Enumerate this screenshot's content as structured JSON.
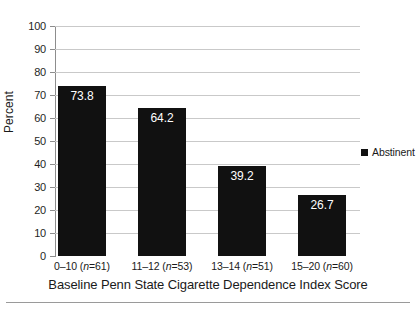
{
  "chart_data": {
    "type": "bar",
    "title": "",
    "subtitle": "",
    "xlabel": "Baseline Penn State Cigarette Dependence Index Score",
    "ylabel": "Percent",
    "categories": [
      "0–10 (n=61)",
      "11–12 (n=53)",
      "13–14 (n=51)",
      "15–20 (n=60)"
    ],
    "category_parts": [
      {
        "range": "0–10",
        "n_prefix": " (",
        "n_var": "n",
        "n_value": "=61)"
      },
      {
        "range": "11–12",
        "n_prefix": " (",
        "n_var": "n",
        "n_value": "=53)"
      },
      {
        "range": "13–14",
        "n_prefix": " (",
        "n_var": "n",
        "n_value": "=51)"
      },
      {
        "range": "15–20",
        "n_prefix": " (",
        "n_var": "n",
        "n_value": "=60)"
      }
    ],
    "values": [
      73.8,
      64.2,
      39.2,
      26.7
    ],
    "value_labels": [
      "73.8",
      "64.2",
      "39.2",
      "26.7"
    ],
    "series": [
      {
        "name": "Abstinent",
        "values": [
          73.8,
          64.2,
          39.2,
          26.7
        ],
        "color": "#111111"
      }
    ],
    "ylim": [
      0,
      100
    ],
    "ytick_step": 10,
    "ytick_labels": [
      "100",
      "90",
      "80",
      "70",
      "60",
      "50",
      "40",
      "30",
      "20",
      "10",
      "0"
    ],
    "grid": true,
    "grid_axis": "y",
    "grid_color": "#c9c9c9",
    "legend_position": "right",
    "legend": [
      {
        "label": "Abstinent",
        "marker": "square",
        "color": "#111111"
      }
    ],
    "bar_color": "#111111",
    "value_label_color": "#ffffff",
    "axis_color": "#8d8d8d",
    "background": "#ffffff"
  },
  "legend": {
    "abstinent_label": "Abstinent"
  },
  "axes": {
    "y_title": "Percent",
    "x_title": "Baseline Penn State Cigarette Dependence Index Score"
  }
}
